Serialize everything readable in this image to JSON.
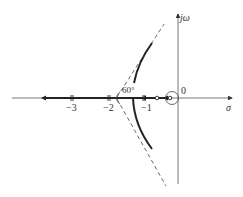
{
  "diagram": {
    "type": "root-locus",
    "axes": {
      "real_axis_label": "σ",
      "imag_axis_label": "jω",
      "origin_label": "0",
      "ticks": [
        {
          "value": -3,
          "label": "−3"
        },
        {
          "value": -2,
          "label": "−2"
        },
        {
          "value": -1,
          "label": "−1"
        }
      ]
    },
    "annotations": {
      "asymptote_angle": "60°"
    },
    "colors": {
      "locus": "#222222",
      "axis": "#555555",
      "asymptote": "#444444"
    }
  }
}
